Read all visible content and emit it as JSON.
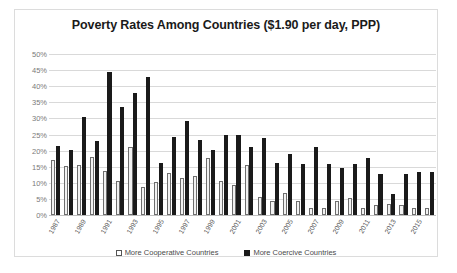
{
  "chart_data": {
    "type": "bar",
    "title": "Poverty Rates Among Countries ($1.90 per day, PPP)",
    "xlabel": "",
    "ylabel": "",
    "ylim": [
      0,
      50
    ],
    "ytick_labels": [
      "50%",
      "45%",
      "40%",
      "35%",
      "30%",
      "25%",
      "20%",
      "15%",
      "10%",
      "5%",
      "0%"
    ],
    "ytick_values": [
      50,
      45,
      40,
      35,
      30,
      25,
      20,
      15,
      10,
      5,
      0
    ],
    "grid": true,
    "legend_position": "bottom",
    "categories": [
      "1987",
      "1988",
      "1989",
      "1990",
      "1991",
      "1992",
      "1993",
      "1994",
      "1995",
      "1996",
      "1997",
      "1998",
      "1999",
      "2000",
      "2001",
      "2002",
      "2003",
      "2004",
      "2005",
      "2006",
      "2007",
      "2008",
      "2009",
      "2010",
      "2011",
      "2012",
      "2013",
      "2014",
      "2015",
      "2016"
    ],
    "tick_labels_shown": [
      "1987",
      "",
      "1989",
      "",
      "1991",
      "",
      "1993",
      "",
      "1995",
      "",
      "1997",
      "",
      "1999",
      "",
      "2001",
      "",
      "2003",
      "",
      "2005",
      "",
      "2007",
      "",
      "2009",
      "",
      "2011",
      "",
      "2013",
      "",
      "2015",
      ""
    ],
    "series": [
      {
        "name": "More Cooperative Countries",
        "color": "#f2f2f2",
        "border_color": "#6e6e6e",
        "values": [
          17.0,
          15.2,
          15.6,
          18.0,
          13.6,
          10.5,
          21.2,
          8.8,
          10.3,
          13.0,
          11.4,
          12.0,
          17.7,
          10.6,
          9.2,
          15.4,
          5.7,
          4.4,
          6.7,
          4.2,
          2.1,
          2.1,
          4.5,
          5.2,
          2.3,
          3.0,
          3.4,
          3.0,
          2.3,
          2.3
        ]
      },
      {
        "name": "More Coercive Countries",
        "color": "#1a1a1a",
        "values": [
          21.5,
          20.1,
          30.4,
          22.9,
          44.3,
          33.6,
          37.8,
          43.0,
          16.0,
          24.2,
          29.2,
          23.4,
          20.2,
          24.7,
          24.7,
          21.0,
          23.8,
          16.3,
          19.1,
          15.7,
          21.2,
          15.7,
          14.6,
          15.9,
          17.6,
          12.7,
          6.6,
          12.7,
          13.5,
          13.5
        ]
      }
    ]
  },
  "legend": {
    "items": [
      {
        "label": "More Cooperative Countries",
        "swatch": "open-square-swatch"
      },
      {
        "label": "More Coercive Countries",
        "swatch": "filled-square-swatch"
      }
    ]
  }
}
